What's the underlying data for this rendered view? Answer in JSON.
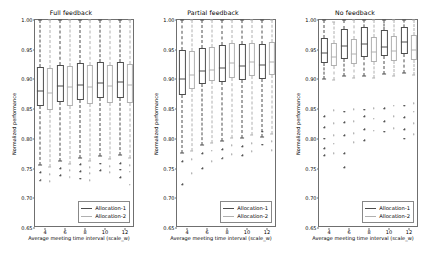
{
  "figure": {
    "width": 426,
    "height": 259,
    "background": "#ffffff",
    "axis_color": "#6f6f6f"
  },
  "legend": {
    "entries": [
      {
        "label": "Allocation-1",
        "color": "#4d4d4d"
      },
      {
        "label": "Allocation-2",
        "color": "#b0b0b0"
      }
    ]
  },
  "chart_data": {
    "type": "box",
    "title": "",
    "xlabel": "Average meeting time interval (scale_w)",
    "ylabel": "Normalized performance",
    "categories": [
      "4",
      "6",
      "8",
      "10",
      "12"
    ],
    "ylim": [
      0.65,
      1.0
    ],
    "yticks": [
      "1.00",
      "0.95",
      "0.90",
      "0.85",
      "0.80",
      "0.75",
      "0.70",
      "0.65"
    ],
    "ytick_values": [
      1.0,
      0.95,
      0.9,
      0.85,
      0.8,
      0.75,
      0.7,
      0.65
    ],
    "grid": false,
    "legend_position": "lower right",
    "panels": [
      {
        "title": "Full feedback",
        "series": [
          {
            "name": "Allocation-1",
            "color": "#4d4d4d",
            "boxes": [
              {
                "x": "4",
                "whisker_low": 0.756,
                "q1": 0.855,
                "median": 0.881,
                "q3": 0.921,
                "whisker_high": 1.0,
                "fliers": [
                  0.744,
                  0.731
                ]
              },
              {
                "x": "6",
                "whisker_low": 0.762,
                "q1": 0.862,
                "median": 0.889,
                "q3": 0.925,
                "whisker_high": 1.0,
                "fliers": [
                  0.751,
                  0.739
                ]
              },
              {
                "x": "8",
                "whisker_low": 0.768,
                "q1": 0.866,
                "median": 0.891,
                "q3": 0.927,
                "whisker_high": 1.0,
                "fliers": [
                  0.757,
                  0.746,
                  0.733
                ]
              },
              {
                "x": "10",
                "whisker_low": 0.771,
                "q1": 0.868,
                "median": 0.894,
                "q3": 0.929,
                "whisker_high": 1.0,
                "fliers": [
                  0.758,
                  0.747
                ]
              },
              {
                "x": "12",
                "whisker_low": 0.773,
                "q1": 0.869,
                "median": 0.895,
                "q3": 0.93,
                "whisker_high": 1.0,
                "fliers": [
                  0.759,
                  0.748,
                  0.735
                ]
              }
            ]
          },
          {
            "name": "Allocation-2",
            "color": "#b0b0b0",
            "boxes": [
              {
                "x": "4",
                "whisker_low": 0.752,
                "q1": 0.848,
                "median": 0.878,
                "q3": 0.919,
                "whisker_high": 1.0,
                "fliers": [
                  0.741,
                  0.729
                ]
              },
              {
                "x": "6",
                "whisker_low": 0.758,
                "q1": 0.855,
                "median": 0.887,
                "q3": 0.922,
                "whisker_high": 1.0,
                "fliers": [
                  0.747,
                  0.736
                ]
              },
              {
                "x": "8",
                "whisker_low": 0.763,
                "q1": 0.858,
                "median": 0.888,
                "q3": 0.924,
                "whisker_high": 1.0,
                "fliers": [
                  0.752,
                  0.742,
                  0.73
                ]
              },
              {
                "x": "10",
                "whisker_low": 0.766,
                "q1": 0.86,
                "median": 0.889,
                "q3": 0.925,
                "whisker_high": 1.0,
                "fliers": [
                  0.754,
                  0.744
                ]
              },
              {
                "x": "12",
                "whisker_low": 0.768,
                "q1": 0.861,
                "median": 0.89,
                "q3": 0.926,
                "whisker_high": 1.0,
                "fliers": [
                  0.756,
                  0.745,
                  0.723
                ]
              }
            ]
          }
        ]
      },
      {
        "title": "Partial feedback",
        "series": [
          {
            "name": "Allocation-1",
            "color": "#4d4d4d",
            "boxes": [
              {
                "x": "4",
                "whisker_low": 0.776,
                "q1": 0.873,
                "median": 0.901,
                "q3": 0.949,
                "whisker_high": 1.0,
                "fliers": [
                  0.762,
                  0.724
                ]
              },
              {
                "x": "6",
                "whisker_low": 0.79,
                "q1": 0.892,
                "median": 0.914,
                "q3": 0.953,
                "whisker_high": 1.0,
                "fliers": [
                  0.776,
                  0.751
                ]
              },
              {
                "x": "8",
                "whisker_low": 0.797,
                "q1": 0.896,
                "median": 0.919,
                "q3": 0.958,
                "whisker_high": 1.0,
                "fliers": [
                  0.783,
                  0.768
                ]
              },
              {
                "x": "10",
                "whisker_low": 0.801,
                "q1": 0.899,
                "median": 0.922,
                "q3": 0.959,
                "whisker_high": 1.0,
                "fliers": [
                  0.788,
                  0.772
                ]
              },
              {
                "x": "12",
                "whisker_low": 0.803,
                "q1": 0.901,
                "median": 0.924,
                "q3": 0.96,
                "whisker_high": 1.0,
                "fliers": [
                  0.812,
                  0.79
                ]
              }
            ]
          },
          {
            "name": "Allocation-2",
            "color": "#b0b0b0",
            "boxes": [
              {
                "x": "4",
                "whisker_low": 0.779,
                "q1": 0.884,
                "median": 0.908,
                "q3": 0.947,
                "whisker_high": 1.0,
                "fliers": [
                  0.766,
                  0.742
                ]
              },
              {
                "x": "6",
                "whisker_low": 0.793,
                "q1": 0.897,
                "median": 0.916,
                "q3": 0.954,
                "whisker_high": 1.0,
                "fliers": [
                  0.78,
                  0.762
                ]
              },
              {
                "x": "8",
                "whisker_low": 0.801,
                "q1": 0.903,
                "median": 0.928,
                "q3": 0.961,
                "whisker_high": 1.0,
                "fliers": [
                  0.789,
                  0.774
                ]
              },
              {
                "x": "10",
                "whisker_low": 0.806,
                "q1": 0.906,
                "median": 0.929,
                "q3": 0.962,
                "whisker_high": 1.0,
                "fliers": [
                  0.793,
                  0.779
                ]
              },
              {
                "x": "12",
                "whisker_low": 0.809,
                "q1": 0.908,
                "median": 0.93,
                "q3": 0.963,
                "whisker_high": 1.0,
                "fliers": [
                  0.796,
                  0.781
                ]
              }
            ]
          }
        ]
      },
      {
        "title": "No feedback",
        "series": [
          {
            "name": "Allocation-1",
            "color": "#4d4d4d",
            "boxes": [
              {
                "x": "4",
                "whisker_low": 0.9,
                "q1": 0.928,
                "median": 0.944,
                "q3": 0.97,
                "whisker_high": 1.0,
                "fliers": [
                  0.838,
                  0.82,
                  0.8,
                  0.784,
                  0.772
                ]
              },
              {
                "x": "6",
                "whisker_low": 0.905,
                "q1": 0.934,
                "median": 0.957,
                "q3": 0.985,
                "whisker_high": 1.0,
                "fliers": [
                  0.846,
                  0.828,
                  0.806,
                  0.776,
                  0.752
                ]
              },
              {
                "x": "8",
                "whisker_low": 0.906,
                "q1": 0.937,
                "median": 0.959,
                "q3": 0.989,
                "whisker_high": 1.0,
                "fliers": [
                  0.849,
                  0.838,
                  0.816,
                  0.798
                ]
              },
              {
                "x": "10",
                "whisker_low": 0.909,
                "q1": 0.939,
                "median": 0.954,
                "q3": 0.984,
                "whisker_high": 1.0,
                "fliers": [
                  0.852,
                  0.83,
                  0.812
                ]
              },
              {
                "x": "12",
                "whisker_low": 0.911,
                "q1": 0.942,
                "median": 0.963,
                "q3": 0.988,
                "whisker_high": 1.0,
                "fliers": [
                  0.856,
                  0.836,
                  0.816,
                  0.8
                ]
              }
            ]
          },
          {
            "name": "Allocation-2",
            "color": "#b0b0b0",
            "boxes": [
              {
                "x": "4",
                "whisker_low": 0.899,
                "q1": 0.922,
                "median": 0.938,
                "q3": 0.962,
                "whisker_high": 0.996,
                "fliers": [
                  0.848,
                  0.826,
                  0.806,
                  0.792,
                  0.776
                ]
              },
              {
                "x": "6",
                "whisker_low": 0.902,
                "q1": 0.926,
                "median": 0.942,
                "q3": 0.968,
                "whisker_high": 1.0,
                "fliers": [
                  0.85,
                  0.83,
                  0.81,
                  0.794
                ]
              },
              {
                "x": "8",
                "whisker_low": 0.903,
                "q1": 0.929,
                "median": 0.946,
                "q3": 0.971,
                "whisker_high": 1.0,
                "fliers": [
                  0.852,
                  0.834,
                  0.814
                ]
              },
              {
                "x": "10",
                "whisker_low": 0.906,
                "q1": 0.931,
                "median": 0.947,
                "q3": 0.973,
                "whisker_high": 1.0,
                "fliers": [
                  0.856,
                  0.838,
                  0.818
                ]
              },
              {
                "x": "12",
                "whisker_low": 0.908,
                "q1": 0.933,
                "median": 0.949,
                "q3": 0.975,
                "whisker_high": 1.0,
                "fliers": [
                  0.86,
                  0.846,
                  0.826,
                  0.808
                ]
              }
            ]
          }
        ]
      }
    ]
  }
}
